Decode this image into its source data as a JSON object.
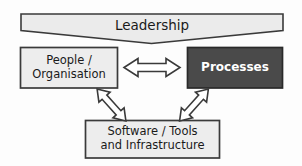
{
  "diagram": {
    "background_color": "#fdfdfd",
    "nodes": {
      "leadership": {
        "name": "leadership-banner",
        "label": "Leadership",
        "shape": "chevron-banner",
        "fill": "#ebebeb",
        "stroke": "#3a3a3a",
        "text_color": "#1a1a1a"
      },
      "people": {
        "name": "people-organisation-box",
        "label_line1": "People /",
        "label_line2": "Organisation",
        "shape": "rectangle",
        "fill": "#ededed",
        "stroke": "#3a3a3a",
        "text_color": "#1a1a1a"
      },
      "processes": {
        "name": "processes-box",
        "label": "Processes",
        "shape": "rectangle",
        "fill": "#4a4a4a",
        "stroke": "#2a2a2a",
        "text_color": "#ffffff"
      },
      "software": {
        "name": "software-tools-box",
        "label_line1": "Software / Tools",
        "label_line2": "and Infrastructure",
        "shape": "rectangle",
        "fill": "#ededed",
        "stroke": "#3a3a3a",
        "text_color": "#1a1a1a"
      }
    },
    "connectors": [
      {
        "name": "people-processes-arrow",
        "style": "double-headed-horizontal",
        "from": "People / Organisation",
        "to": "Processes",
        "fill": "#ffffff",
        "stroke": "#3a3a3a"
      },
      {
        "name": "people-software-arrow",
        "style": "double-headed-diagonal",
        "from": "People / Organisation",
        "to": "Software / Tools and Infrastructure",
        "fill": "#ffffff",
        "stroke": "#3a3a3a"
      },
      {
        "name": "processes-software-arrow",
        "style": "double-headed-diagonal",
        "from": "Processes",
        "to": "Software / Tools and Infrastructure",
        "fill": "#ffffff",
        "stroke": "#3a3a3a"
      }
    ]
  }
}
